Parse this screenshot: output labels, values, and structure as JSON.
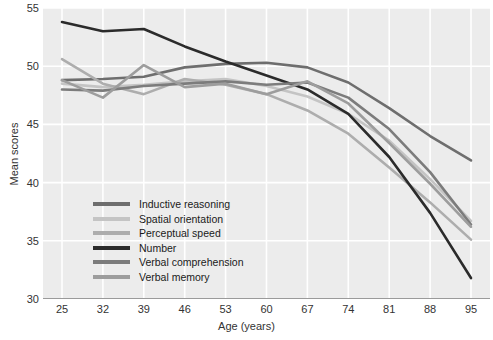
{
  "chart_data": {
    "type": "line",
    "title": "",
    "xlabel": "Age (years)",
    "ylabel": "Mean scores",
    "x": [
      25,
      32,
      39,
      46,
      53,
      60,
      67,
      74,
      81,
      88,
      95
    ],
    "xlim": [
      25,
      95
    ],
    "ylim": [
      30,
      55
    ],
    "xticks": [
      "25",
      "32",
      "39",
      "46",
      "53",
      "60",
      "67",
      "74",
      "81",
      "88",
      "95"
    ],
    "yticks": [
      "55",
      "50",
      "45",
      "40",
      "35",
      "30"
    ],
    "grid": "white gridlines on light gray panel",
    "legend_position": "inside lower-left of plot area",
    "series": [
      {
        "name": "Inductive reasoning",
        "color": "#6e6e6e",
        "values": [
          48.8,
          48.9,
          49.1,
          49.9,
          50.2,
          50.3,
          49.9,
          48.6,
          46.4,
          44.0,
          41.9
        ]
      },
      {
        "name": "Spatial orientation",
        "color": "#c4c4c4",
        "values": [
          48.5,
          48.2,
          48.4,
          48.7,
          48.9,
          48.3,
          47.4,
          45.9,
          43.6,
          40.3,
          36.7
        ]
      },
      {
        "name": "Perceptual speed",
        "color": "#adadad",
        "values": [
          50.6,
          48.5,
          47.6,
          48.9,
          48.4,
          47.6,
          46.2,
          44.2,
          41.3,
          38.3,
          35.1
        ]
      },
      {
        "name": "Number",
        "color": "#2b2b2b",
        "values": [
          53.8,
          53.0,
          53.2,
          51.7,
          50.4,
          49.2,
          48.0,
          45.9,
          42.2,
          37.4,
          31.8
        ]
      },
      {
        "name": "Verbal comprehension",
        "color": "#7c7c7c",
        "values": [
          48.0,
          47.9,
          48.3,
          48.5,
          48.7,
          48.4,
          48.6,
          47.3,
          44.6,
          40.9,
          36.4
        ]
      },
      {
        "name": "Verbal memory",
        "color": "#9d9d9d",
        "values": [
          48.8,
          47.3,
          50.1,
          48.2,
          48.5,
          47.6,
          48.7,
          46.8,
          43.4,
          39.9,
          36.2
        ]
      }
    ]
  },
  "legend": {
    "items": [
      {
        "label": "Inductive reasoning",
        "color": "#6e6e6e"
      },
      {
        "label": "Spatial orientation",
        "color": "#c4c4c4"
      },
      {
        "label": "Perceptual speed",
        "color": "#adadad"
      },
      {
        "label": "Number",
        "color": "#2b2b2b"
      },
      {
        "label": "Verbal comprehension",
        "color": "#7c7c7c"
      },
      {
        "label": "Verbal memory",
        "color": "#9d9d9d"
      }
    ]
  },
  "colors": {
    "panel_background": "#ececec",
    "gridline": "#ffffff",
    "axis_line": "#9a9a9a",
    "tick_text": "#333333"
  }
}
